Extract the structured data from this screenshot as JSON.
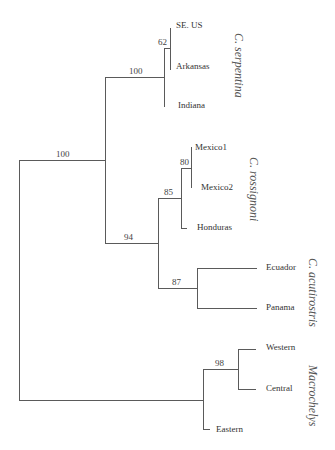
{
  "figure": {
    "type": "phylogenetic-tree",
    "tips": [
      "SE. US",
      "Arkansas",
      "Indiana",
      "Mexico1",
      "Mexico2",
      "Honduras",
      "Ecuador",
      "Panama",
      "Western",
      "Central",
      "Eastern"
    ],
    "support": {
      "root_ingroup": "100",
      "serpentina": "100",
      "se_arkansas": "62",
      "rossignoni_acutirostris": "94",
      "rossignoni": "85",
      "mexico": "80",
      "acutirostris": "87",
      "macrochelys_west_central": "98"
    },
    "clades": {
      "serpentina": "C. serpentina",
      "rossignoni": "C. rossignoni",
      "acutirostris": "C. acutirostris",
      "macrochelys": "Macrochelys"
    }
  }
}
